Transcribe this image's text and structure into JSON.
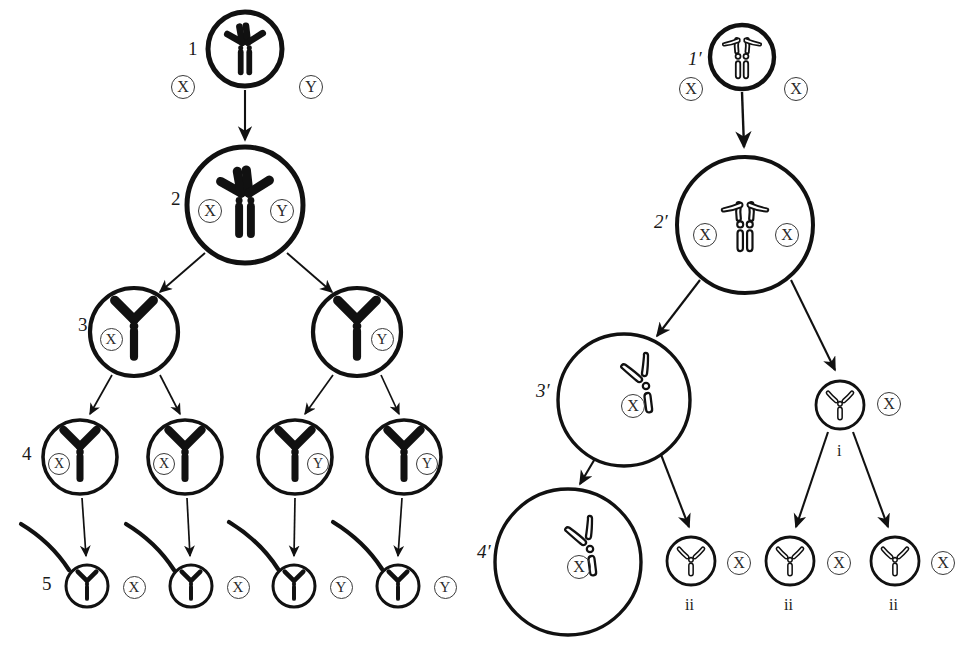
{
  "figure": {
    "type": "cell-lineage-chromosome-diagram",
    "title": "",
    "panels": [
      {
        "id": "left-panel",
        "name": "XY lineage",
        "chromosome_style": "solid",
        "stages": [
          {
            "label": "1",
            "cells": [
              {
                "id": "L1",
                "cx": 245,
                "cy": 49,
                "r": 37,
                "chromosome": "paired-V-double",
                "sex_labels": [
                  {
                    "text": "X",
                    "side": "left"
                  },
                  {
                    "text": "Y",
                    "side": "right"
                  }
                ],
                "stage_label_side": "left"
              }
            ]
          },
          {
            "label": "2",
            "cells": [
              {
                "id": "L2",
                "cx": 245,
                "cy": 205,
                "r": 58,
                "chromosome": "paired-V-double",
                "sex_labels": [
                  {
                    "text": "X",
                    "side": "inner-left"
                  },
                  {
                    "text": "Y",
                    "side": "inner-right"
                  }
                ],
                "stage_label_side": "left"
              }
            ]
          },
          {
            "label": "3",
            "cells": [
              {
                "id": "L3a",
                "cx": 134,
                "cy": 332,
                "r": 44,
                "chromosome": "single-V",
                "sex_labels": [
                  {
                    "text": "X",
                    "side": "inner-left"
                  }
                ],
                "stage_label_side": "left"
              },
              {
                "id": "L3b",
                "cx": 357,
                "cy": 332,
                "r": 44,
                "chromosome": "single-V",
                "sex_labels": [
                  {
                    "text": "Y",
                    "side": "inner-right"
                  }
                ],
                "stage_label_side": "none"
              }
            ]
          },
          {
            "label": "4",
            "cells": [
              {
                "id": "L4a",
                "cx": 80,
                "cy": 457,
                "r": 37,
                "chromosome": "single-V",
                "sex_labels": [
                  {
                    "text": "X",
                    "side": "inner-left"
                  }
                ],
                "stage_label_side": "left"
              },
              {
                "id": "L4b",
                "cx": 185,
                "cy": 457,
                "r": 37,
                "chromosome": "single-V",
                "sex_labels": [
                  {
                    "text": "X",
                    "side": "inner-left"
                  }
                ],
                "stage_label_side": "none"
              },
              {
                "id": "L4c",
                "cx": 295,
                "cy": 457,
                "r": 37,
                "chromosome": "single-V",
                "sex_labels": [
                  {
                    "text": "Y",
                    "side": "inner-right"
                  }
                ],
                "stage_label_side": "none"
              },
              {
                "id": "L4d",
                "cx": 404,
                "cy": 457,
                "r": 37,
                "chromosome": "single-V",
                "sex_labels": [
                  {
                    "text": "Y",
                    "side": "inner-right"
                  }
                ],
                "stage_label_side": "none"
              }
            ]
          },
          {
            "label": "5",
            "cells": [
              {
                "id": "L5a",
                "cx": 87,
                "cy": 586,
                "r": 21,
                "chromosome": "single-V",
                "flagellum": true,
                "sex_labels": [
                  {
                    "text": "X",
                    "side": "right"
                  }
                ],
                "stage_label_side": "left"
              },
              {
                "id": "L5b",
                "cx": 191,
                "cy": 586,
                "r": 21,
                "chromosome": "single-V",
                "flagellum": true,
                "sex_labels": [
                  {
                    "text": "X",
                    "side": "right"
                  }
                ],
                "stage_label_side": "none"
              },
              {
                "id": "L5c",
                "cx": 294,
                "cy": 586,
                "r": 21,
                "chromosome": "single-V",
                "flagellum": true,
                "sex_labels": [
                  {
                    "text": "Y",
                    "side": "right"
                  }
                ],
                "stage_label_side": "none"
              },
              {
                "id": "L5d",
                "cx": 398,
                "cy": 586,
                "r": 21,
                "chromosome": "single-V",
                "flagellum": true,
                "sex_labels": [
                  {
                    "text": "Y",
                    "side": "right"
                  }
                ],
                "stage_label_side": "none"
              }
            ]
          }
        ]
      },
      {
        "id": "right-panel",
        "name": "XX lineage",
        "chromosome_style": "outline",
        "stages": [
          {
            "label": "1′",
            "cells": [
              {
                "id": "R1",
                "cx": 742,
                "cy": 57,
                "r": 32,
                "chromosome": "paired-V-double-outline",
                "sex_labels": [
                  {
                    "text": "X",
                    "side": "left"
                  },
                  {
                    "text": "X",
                    "side": "right"
                  }
                ]
              }
            ]
          },
          {
            "label": "2′",
            "cells": [
              {
                "id": "R2",
                "cx": 745,
                "cy": 225,
                "r": 68,
                "chromosome": "paired-V-double-outline",
                "sex_labels": [
                  {
                    "text": "X",
                    "side": "inner-left"
                  },
                  {
                    "text": "X",
                    "side": "inner-right"
                  }
                ]
              }
            ]
          },
          {
            "label": "3′",
            "cells": [
              {
                "id": "R3",
                "cx": 624,
                "cy": 400,
                "r": 66,
                "chromosome": "offset-V-outline",
                "sex_labels": [
                  {
                    "text": "X",
                    "side": "center"
                  }
                ]
              }
            ]
          },
          {
            "label": "4′",
            "cells": [
              {
                "id": "R4",
                "cx": 568,
                "cy": 562,
                "r": 73,
                "chromosome": "offset-V-outline",
                "sex_labels": [
                  {
                    "text": "X",
                    "side": "center"
                  }
                ]
              }
            ]
          },
          {
            "label": "i",
            "cells": [
              {
                "id": "Ri",
                "cx": 840,
                "cy": 405,
                "r": 24,
                "chromosome": "single-V-outline",
                "sex_labels": [
                  {
                    "text": "X",
                    "side": "right"
                  }
                ],
                "roman_below": "i"
              }
            ]
          },
          {
            "label": "ii",
            "cells": [
              {
                "id": "Rii1",
                "cx": 691,
                "cy": 561,
                "r": 24,
                "chromosome": "single-V-outline",
                "sex_labels": [
                  {
                    "text": "X",
                    "side": "right"
                  }
                ],
                "roman_below": "ii"
              },
              {
                "id": "Rii2",
                "cx": 790,
                "cy": 561,
                "r": 24,
                "chromosome": "single-V-outline",
                "sex_labels": [
                  {
                    "text": "X",
                    "side": "right"
                  }
                ],
                "roman_below": "ii"
              },
              {
                "id": "Rii3",
                "cx": 895,
                "cy": 561,
                "r": 24,
                "chromosome": "single-V-outline",
                "sex_labels": [
                  {
                    "text": "X",
                    "side": "right"
                  }
                ],
                "roman_below": "ii"
              }
            ]
          }
        ]
      }
    ],
    "stage_labels": [
      {
        "id": "sl-1",
        "text": "1",
        "x": 188,
        "y": 50,
        "italic": false
      },
      {
        "id": "sl-2",
        "text": "2",
        "x": 171,
        "y": 200,
        "italic": false
      },
      {
        "id": "sl-3",
        "text": "3",
        "x": 78,
        "y": 326,
        "italic": false
      },
      {
        "id": "sl-4",
        "text": "4",
        "x": 22,
        "y": 455,
        "italic": false
      },
      {
        "id": "sl-5",
        "text": "5",
        "x": 42,
        "y": 585,
        "italic": false
      },
      {
        "id": "sl-1p",
        "text": "1′",
        "x": 688,
        "y": 60,
        "italic": true
      },
      {
        "id": "sl-2p",
        "text": "2′",
        "x": 654,
        "y": 223,
        "italic": true
      },
      {
        "id": "sl-3p",
        "text": "3′",
        "x": 536,
        "y": 392,
        "italic": true
      },
      {
        "id": "sl-4p",
        "text": "4′",
        "x": 477,
        "y": 553,
        "italic": true
      }
    ],
    "roman_labels": [
      {
        "id": "rl-i",
        "text": "i",
        "x": 837,
        "y": 452
      },
      {
        "id": "rl-ii1",
        "text": "ii",
        "x": 685,
        "y": 606
      },
      {
        "id": "rl-ii2",
        "text": "ii",
        "x": 784,
        "y": 606
      },
      {
        "id": "rl-ii3",
        "text": "ii",
        "x": 889,
        "y": 606
      }
    ],
    "sex_chips": [
      {
        "id": "sc-1-x",
        "text": "X",
        "cx": 182,
        "cy": 86,
        "d": 22
      },
      {
        "id": "sc-1-y",
        "text": "Y",
        "cx": 310,
        "cy": 86,
        "d": 22
      },
      {
        "id": "sc-2-x",
        "text": "X",
        "cx": 209,
        "cy": 210,
        "d": 22
      },
      {
        "id": "sc-2-y",
        "text": "Y",
        "cx": 281,
        "cy": 210,
        "d": 22
      },
      {
        "id": "sc-3a-x",
        "text": "X",
        "cx": 110,
        "cy": 338,
        "d": 21
      },
      {
        "id": "sc-3b-y",
        "text": "Y",
        "cx": 381,
        "cy": 338,
        "d": 21
      },
      {
        "id": "sc-4a-x",
        "text": "X",
        "cx": 58,
        "cy": 463,
        "d": 20
      },
      {
        "id": "sc-4b-x",
        "text": "X",
        "cx": 163,
        "cy": 463,
        "d": 20
      },
      {
        "id": "sc-4c-y",
        "text": "Y",
        "cx": 317,
        "cy": 463,
        "d": 20
      },
      {
        "id": "sc-4d-y",
        "text": "Y",
        "cx": 426,
        "cy": 463,
        "d": 20
      },
      {
        "id": "sc-5a-x",
        "text": "X",
        "cx": 133,
        "cy": 586,
        "d": 21
      },
      {
        "id": "sc-5b-x",
        "text": "X",
        "cx": 237,
        "cy": 586,
        "d": 21
      },
      {
        "id": "sc-5c-y",
        "text": "Y",
        "cx": 340,
        "cy": 586,
        "d": 21
      },
      {
        "id": "sc-5d-y",
        "text": "Y",
        "cx": 444,
        "cy": 586,
        "d": 21
      },
      {
        "id": "sc-1p-l",
        "text": "X",
        "cx": 690,
        "cy": 88,
        "d": 22
      },
      {
        "id": "sc-1p-r",
        "text": "X",
        "cx": 795,
        "cy": 88,
        "d": 22
      },
      {
        "id": "sc-2p-l",
        "text": "X",
        "cx": 704,
        "cy": 234,
        "d": 22
      },
      {
        "id": "sc-2p-r",
        "text": "X",
        "cx": 786,
        "cy": 234,
        "d": 22
      },
      {
        "id": "sc-3p-c",
        "text": "X",
        "cx": 632,
        "cy": 405,
        "d": 22
      },
      {
        "id": "sc-4p-c",
        "text": "X",
        "cx": 578,
        "cy": 566,
        "d": 22
      },
      {
        "id": "sc-i-r",
        "text": "X",
        "cx": 888,
        "cy": 403,
        "d": 22
      },
      {
        "id": "sc-ii1",
        "text": "X",
        "cx": 738,
        "cy": 562,
        "d": 22
      },
      {
        "id": "sc-ii2",
        "text": "X",
        "cx": 838,
        "cy": 562,
        "d": 22
      },
      {
        "id": "sc-ii3",
        "text": "X",
        "cx": 942,
        "cy": 562,
        "d": 22
      }
    ],
    "colors": {
      "ink": "#111111",
      "chip_stroke": "#3a3a3a",
      "background": "#ffffff"
    }
  }
}
